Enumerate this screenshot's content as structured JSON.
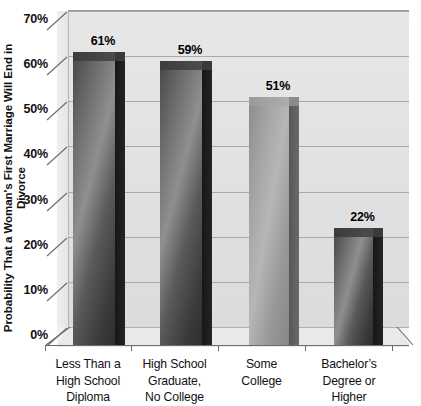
{
  "chart_data": {
    "type": "bar",
    "title": "",
    "xlabel": "",
    "ylabel": "Probability That a Woman's First Marriage Will End in Divorce",
    "ylim": [
      0,
      70
    ],
    "ytick_labels": [
      "70%",
      "60%",
      "50%",
      "40%",
      "30%",
      "20%",
      "10%",
      "0%"
    ],
    "ytick_values": [
      70,
      60,
      50,
      40,
      30,
      20,
      10,
      0
    ],
    "grid": true,
    "legend": "none",
    "style": "3d-bar",
    "categories": [
      "Less Than a High School Diploma",
      "High School Graduate, No College",
      "Some College",
      "Bachelor’s Degree or Higher"
    ],
    "category_lines": [
      [
        "Less Than a",
        "High School",
        "Diploma"
      ],
      [
        "High School",
        "Graduate,",
        "No College"
      ],
      [
        "Some",
        "College"
      ],
      [
        "Bachelor’s",
        "Degree or",
        "Higher"
      ]
    ],
    "values": [
      61,
      59,
      51,
      22
    ],
    "data_labels": [
      "61%",
      "59%",
      "51%",
      "22%"
    ],
    "bar_colors": [
      "#3a3a3a",
      "#3a3a3a",
      "#9a9a9a",
      "#3a3a3a"
    ],
    "background_color": "#e3e3e3",
    "axis_color": "#6d6d6d",
    "gridline_color": "#a9a9a9"
  }
}
